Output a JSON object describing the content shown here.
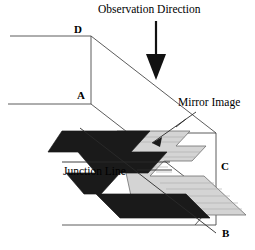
{
  "figure": {
    "background_color": "#ffffff",
    "line_color": "#000000",
    "shape_dark_color": "#1a1a1a",
    "shape_light_color": "#d4d4d4",
    "labels": {
      "observation_direction": "Observation Direction",
      "mirror_image": "Mirror Image",
      "junction_line": "Junction Line"
    },
    "vertices": {
      "a": "A",
      "b": "B",
      "c": "C",
      "d": "D"
    },
    "icons": {
      "observation_arrow": "down-arrow-icon",
      "mirror_leader": "leader-line-icon",
      "junction_leader": "leader-line-icon"
    }
  }
}
